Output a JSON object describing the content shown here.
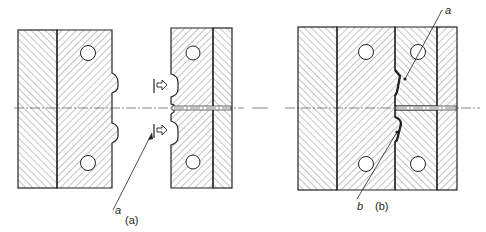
{
  "figure": {
    "panels": [
      {
        "id": "a",
        "caption": "(a)",
        "callouts": [
          {
            "label": "a"
          }
        ]
      },
      {
        "id": "b",
        "caption": "(b)",
        "callouts": [
          {
            "label": "a"
          },
          {
            "label": "b"
          }
        ]
      }
    ],
    "colors": {
      "line": "#222222",
      "hatch": "#555555",
      "background": "#ffffff"
    }
  }
}
